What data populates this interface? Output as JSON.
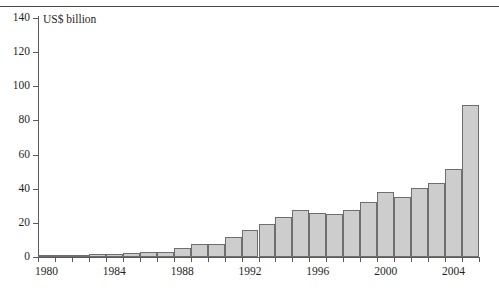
{
  "chart_data": {
    "type": "bar",
    "title": "",
    "subtitle": "",
    "unit_label": "US$ billion",
    "xlabel": "",
    "ylabel": "",
    "ylim": [
      0,
      140
    ],
    "y_ticks": [
      0,
      20,
      40,
      60,
      80,
      100,
      120,
      140
    ],
    "y_tick_labels": [
      "0",
      "20",
      "40",
      "60",
      "80",
      "100",
      "120",
      "140"
    ],
    "grid": false,
    "legend": null,
    "x_tick_labels": [
      "1980",
      "1984",
      "1988",
      "1992",
      "1996",
      "2000",
      "2004"
    ],
    "x_tick_label_years": [
      1980,
      1984,
      1988,
      1992,
      1996,
      2000,
      2004
    ],
    "categories": [
      "1980",
      "1981",
      "1982",
      "1983",
      "1984",
      "1985",
      "1986",
      "1987",
      "1988",
      "1989",
      "1990",
      "1991",
      "1992",
      "1993",
      "1994",
      "1995",
      "1996",
      "1997",
      "1998",
      "1999",
      "2000",
      "2001",
      "2002",
      "2003",
      "2004",
      "2005"
    ],
    "values": [
      0.6,
      0.8,
      1.0,
      1.6,
      1.7,
      2.6,
      3.0,
      3.2,
      5.5,
      7.5,
      7.4,
      11.8,
      16.0,
      19.5,
      23.5,
      27.8,
      26.0,
      25.3,
      27.5,
      32.0,
      38.0,
      35.0,
      40.5,
      43.5,
      51.5,
      89.0
    ],
    "bar_color": "#cdcdcd",
    "bar_border_color": "#6e6e6e",
    "axis_color": "#5a5a5a",
    "text_color": "#1f1f1f",
    "background_color": "#ffffff"
  },
  "figure": {
    "unit_label": "US$ billion"
  }
}
